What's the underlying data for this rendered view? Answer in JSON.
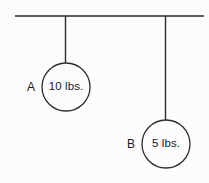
{
  "figure": {
    "background_color": "#fcfcfc",
    "stroke_color": "#2b2b2b",
    "text_color": "#1a1a1a",
    "ceiling": {
      "name": "ceiling-line",
      "x1": 15,
      "y1": 16,
      "x2": 204,
      "y2": 16
    },
    "objects": [
      {
        "id": "A",
        "label": "A",
        "mass_text": "10 lbs.",
        "label_x": 31,
        "label_y": 87,
        "circle": {
          "cx": 66,
          "cy": 87,
          "r": 24
        },
        "string": {
          "x1": 65.5,
          "y1": 16,
          "x2": 65.5,
          "y2": 63
        }
      },
      {
        "id": "B",
        "label": "B",
        "mass_text": "5 lbs.",
        "label_x": 131,
        "label_y": 144,
        "circle": {
          "cx": 166,
          "cy": 144,
          "r": 24
        },
        "string": {
          "x1": 165.5,
          "y1": 16,
          "x2": 165.5,
          "y2": 120
        }
      }
    ]
  }
}
